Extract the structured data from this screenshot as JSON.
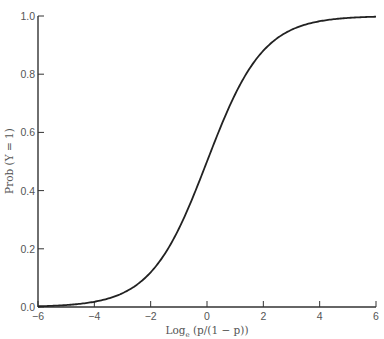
{
  "chart_data": {
    "type": "line",
    "title": "",
    "xlabel": "Log_e (p/(1 − p))",
    "xlabel_main": "Log",
    "xlabel_sub": "e",
    "xlabel_rest": " (p/(1 − p))",
    "ylabel": "Prob (Y = 1)",
    "xlim": [
      -6,
      6
    ],
    "ylim": [
      0,
      1.0
    ],
    "grid": false,
    "x_ticks": [
      "−6",
      "−4",
      "−2",
      "0",
      "2",
      "4",
      "6"
    ],
    "y_ticks": [
      "0.0",
      "0.2",
      "0.4",
      "0.6",
      "0.8",
      "1.0"
    ],
    "series": [
      {
        "name": "logistic",
        "x": [
          -6,
          -5,
          -4,
          -3,
          -2,
          -1,
          0,
          1,
          2,
          3,
          4,
          5,
          6
        ],
        "y": [
          0.002,
          0.007,
          0.018,
          0.047,
          0.119,
          0.269,
          0.5,
          0.731,
          0.881,
          0.953,
          0.982,
          0.993,
          0.998
        ]
      }
    ]
  }
}
